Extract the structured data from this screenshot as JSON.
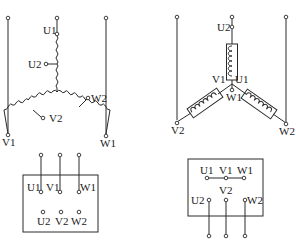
{
  "diagrams": {
    "left": {
      "type": "star-connection-winding",
      "labels": {
        "u1": "U1",
        "u2": "U2",
        "v1": "V1",
        "v2": "V2",
        "w1": "W1",
        "w2": "W2"
      },
      "terminal_box": {
        "top_row": [
          "U1",
          "V1",
          "W1"
        ],
        "bottom_row": [
          "U2",
          "V2",
          "W2"
        ]
      }
    },
    "right": {
      "type": "star-connection-winding",
      "labels": {
        "u1": "U1",
        "u2": "U2",
        "v1": "V1",
        "v2": "V2",
        "w1": "W1",
        "w2": "W2"
      },
      "terminal_box": {
        "top_row": [
          "U1",
          "V1",
          "W1"
        ],
        "mid_label": "V2",
        "bottom_row": [
          "U2",
          "W2"
        ]
      }
    }
  }
}
